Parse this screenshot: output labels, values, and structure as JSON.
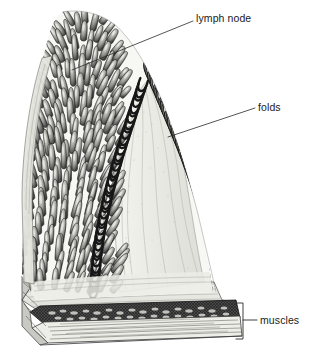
{
  "figure": {
    "style": "grayscale engraving",
    "background_color": "#ffffff",
    "ink_color": "#1a1a1a"
  },
  "labels": {
    "lymph_node": "lymph node",
    "folds": "folds",
    "muscles": "muscles"
  },
  "leaders": {
    "lymph_node": {
      "from_x": 193,
      "from_y": 21,
      "to_x": 72,
      "to_y": 70
    },
    "folds": {
      "from_x": 255,
      "from_y": 108,
      "to_x": 168,
      "to_y": 137
    },
    "muscles_bracket": {
      "x": 243,
      "top_y": 303,
      "bottom_y": 339,
      "tick_y": 320,
      "tick_to_x": 257
    }
  },
  "structures": [
    {
      "name": "villi-surface",
      "region": "upper-left mound",
      "description": "dense finger-like villi in 3D surface view"
    },
    {
      "name": "villi-profile",
      "region": "right cut edge",
      "description": "hairpin loop villi profiles along sectioned fold"
    },
    {
      "name": "lamina-propria-core",
      "region": "center",
      "description": "pale connective tissue core of the fold"
    },
    {
      "name": "submucosa",
      "region": "lower band",
      "description": "pale fibrous band above muscle"
    },
    {
      "name": "circular-muscle",
      "region": "dark band",
      "description": "dark stippled circular muscle layer"
    },
    {
      "name": "longitudinal-muscle",
      "region": "lower band",
      "description": "light layer with long horizontal striations"
    }
  ],
  "colors": {
    "ink": "#1a1a1a",
    "tissue_mid": "#8d8d8d",
    "tissue_light": "#d8d8d4",
    "tissue_pale": "#efefea",
    "muscle_dark": "#2b2b2b",
    "leader": "#2a2a2a"
  }
}
